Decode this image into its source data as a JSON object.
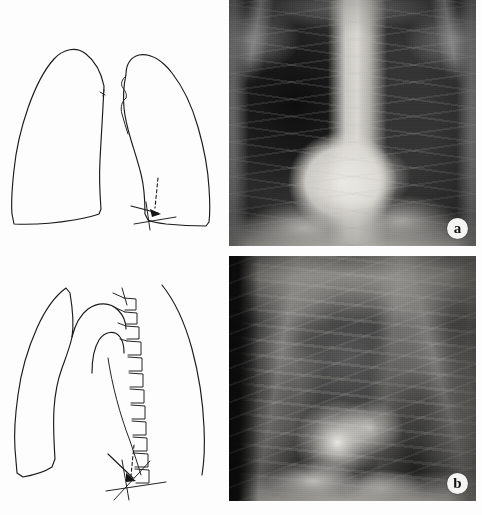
{
  "figure": {
    "kind": "medical-radiology-figure",
    "layout": "2-rows x 2-columns: schematic line drawing left, chest radiograph right",
    "background_color": "#fdfdfd",
    "ink_color": "#1a1a1a"
  },
  "panels": [
    {
      "id": "a",
      "label": "a",
      "row": 1,
      "diagram": {
        "name": "pa-chest-outline",
        "view": "PA (frontal / posteroanterior)",
        "description": "Outline drawing of both lung fields with mediastinal borders; dashed arrow indicates an abnormality at the left cardiophrenic / lower-zone region",
        "annotations": [
          {
            "type": "tick-mark",
            "side": "right-lung-medial-border"
          },
          {
            "type": "dashed-pointer",
            "side": "left-lower-zone"
          },
          {
            "type": "arrowhead",
            "side": "left-cardiophrenic-angle"
          },
          {
            "type": "cross-hatch",
            "side": "left-base"
          }
        ]
      },
      "radiograph": {
        "name": "pa-chest-radiograph",
        "view": "PA (frontal / posteroanterior)",
        "modality": "plain radiograph",
        "tone": "greyscale"
      }
    },
    {
      "id": "b",
      "label": "b",
      "row": 2,
      "diagram": {
        "name": "lateral-chest-outline",
        "view": "Lateral",
        "description": "Outline drawing of the lateral chest showing anterior chest wall, diaphragm, aortic arch and the thoracic vertebral column drawn as stacked vertebral bodies with spinous processes; arrow points to an abnormality overlying the lower thoracic spine / posterior costophrenic region",
        "annotations": [
          {
            "type": "vertebral-column",
            "count": 12
          },
          {
            "type": "aortic-arch-outline"
          },
          {
            "type": "dashed-pointer",
            "side": "lower-thoracic-spine"
          },
          {
            "type": "arrowhead",
            "side": "posterior-costophrenic-recess"
          },
          {
            "type": "cross-hatch",
            "side": "lower-thoracic-spine"
          }
        ]
      },
      "radiograph": {
        "name": "lateral-chest-radiograph",
        "view": "Lateral",
        "modality": "plain radiograph",
        "tone": "greyscale"
      }
    }
  ],
  "labels": {
    "panel_a": "a",
    "panel_b": "b"
  }
}
